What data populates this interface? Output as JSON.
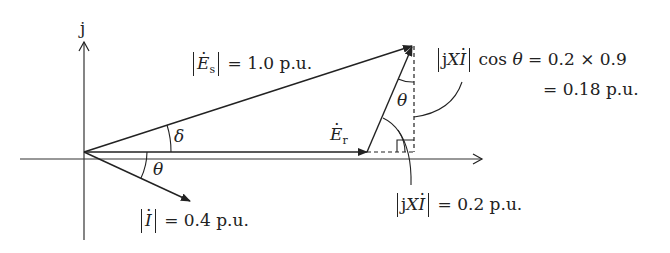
{
  "diagram": {
    "type": "phasor-diagram",
    "axis_imag_label": "j",
    "vectors": {
      "Es": {
        "symbol": "E",
        "subscript": "s",
        "magnitude_label": "= 1.0 p.u."
      },
      "Er": {
        "symbol": "E",
        "subscript": "r"
      },
      "I": {
        "symbol": "I",
        "magnitude_label": "= 0.4 p.u."
      },
      "jXI": {
        "symbol_prefix": "j",
        "symbol_X": "X",
        "symbol_I": "I",
        "magnitude_label": "= 0.2 p.u."
      }
    },
    "angles": {
      "delta": "δ",
      "theta": "θ",
      "theta_between_jXI_and_vertical": "θ",
      "theta_at_origin": "θ"
    },
    "annotation": {
      "line1_func": "cos",
      "line1_var": "θ",
      "line1_rhs": "= 0.2 × 0.9",
      "line2": "= 0.18 p.u."
    },
    "colors": {
      "stroke": "#222222",
      "background": "#ffffff"
    }
  }
}
